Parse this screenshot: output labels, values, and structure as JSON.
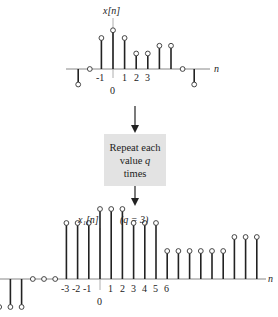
{
  "top_plot": {
    "title": "x[n]",
    "axis_label": "n",
    "tick_labels": [
      "-1",
      "0",
      "1",
      "2",
      "3"
    ]
  },
  "process_box": {
    "line1": "Repeat each",
    "line2_prefix": "value ",
    "line2_var": "q",
    "line3": "times"
  },
  "bottom_plot": {
    "title": "x₁[n]",
    "title_param": "(q = 3)",
    "axis_label": "n",
    "tick_labels": [
      "-3",
      "-2",
      "-1",
      "0",
      "1",
      "2",
      "3",
      "4",
      "5",
      "6"
    ]
  },
  "chart_data": [
    {
      "type": "stem",
      "title": "x[n]",
      "xlabel": "n",
      "x": [
        -3,
        -2,
        -1,
        0,
        1,
        2,
        3,
        4,
        5,
        6,
        7
      ],
      "values": [
        -0.5,
        0,
        1.0,
        1.25,
        1.0,
        0.5,
        0.5,
        0.75,
        0.75,
        0,
        -0.5
      ]
    },
    {
      "type": "stem",
      "title": "x1[n] (q = 3)",
      "xlabel": "n",
      "x": [
        -9,
        -8,
        -7,
        -6,
        -5,
        -4,
        -3,
        -2,
        -1,
        0,
        1,
        2,
        3,
        4,
        5,
        6,
        7,
        8,
        9,
        10,
        11,
        12,
        13,
        14,
        15,
        16,
        17,
        18,
        19,
        20
      ],
      "values": [
        -0.5,
        -0.5,
        -0.5,
        0,
        0,
        0,
        1.0,
        1.0,
        1.0,
        1.25,
        1.25,
        1.25,
        1.0,
        1.0,
        1.0,
        0.5,
        0.5,
        0.5,
        0.5,
        0.5,
        0.5,
        0.75,
        0.75,
        0.75
      ]
    }
  ]
}
